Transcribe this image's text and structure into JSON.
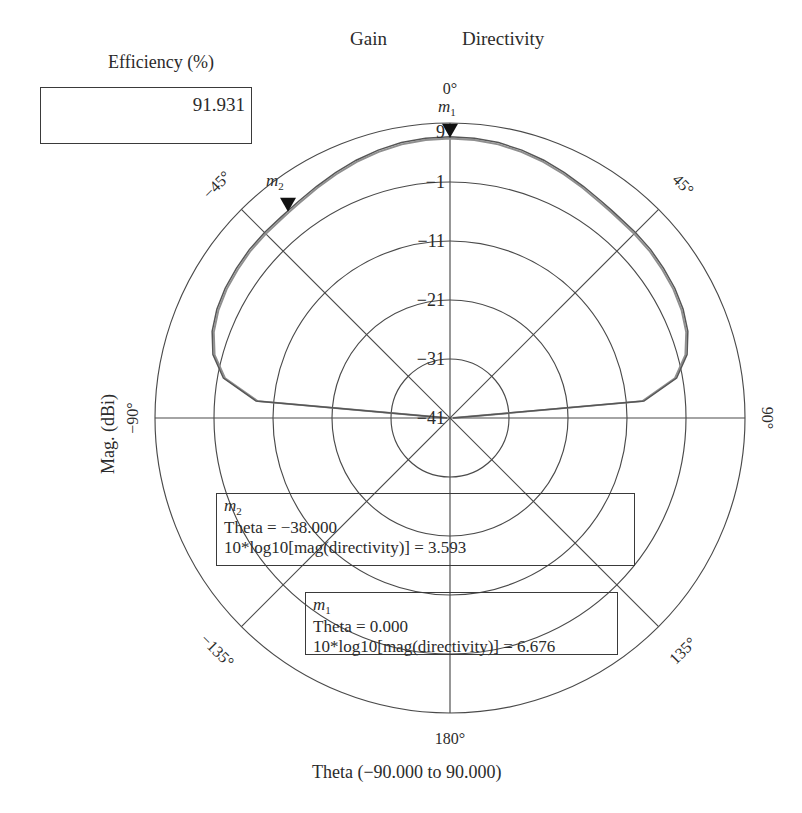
{
  "titles": {
    "gain": "Gain",
    "directivity": "Directivity"
  },
  "efficiency": {
    "caption": "Efficiency (%)",
    "value": "91.931"
  },
  "axes": {
    "y_caption": "Mag. (dBi)",
    "x_caption": "Theta (−90.000 to 90.000)"
  },
  "radial_ticks": [
    {
      "label": "9",
      "value": 9
    },
    {
      "label": "−1",
      "value": -1
    },
    {
      "label": "−11",
      "value": -11
    },
    {
      "label": "−21",
      "value": -21
    },
    {
      "label": "−31",
      "value": -31
    },
    {
      "label": "−41",
      "value": -41
    }
  ],
  "angular_ticks": [
    {
      "label": "0°",
      "angle": 0
    },
    {
      "label": "45°",
      "angle": 45
    },
    {
      "label": "90°",
      "angle": 90
    },
    {
      "label": "135°",
      "angle": 135
    },
    {
      "label": "180°",
      "angle": 180
    },
    {
      "label": "−135°",
      "angle": -135
    },
    {
      "label": "−90°",
      "angle": -90
    },
    {
      "label": "−45°",
      "angle": -45
    }
  ],
  "markers": [
    {
      "name": "m1",
      "tag": "m",
      "sub": "1",
      "theta_row": "Theta = 0.000",
      "value_row": "10*log10[mag(directivity)] = 6.676",
      "theta": 0.0,
      "value": 6.676
    },
    {
      "name": "m2",
      "tag": "m",
      "sub": "2",
      "theta_row": "Theta = −38.000",
      "value_row": "10*log10[mag(directivity)] = 3.593",
      "theta": -38.0,
      "value": 3.593
    }
  ],
  "colors": {
    "grid": "#4a4a4a",
    "trace_gain": "#8a8a8a",
    "trace_directivity": "#555555",
    "marker": "#111111",
    "text": "#2b2b2b"
  },
  "chart_data": {
    "type": "line",
    "plot_kind": "polar-radiation-pattern",
    "xlabel": "Theta (−90.000 to 90.000)",
    "ylabel": "Mag. (dBi)",
    "grid": true,
    "legend_position": "top",
    "rlim": [
      -41,
      9
    ],
    "r_tick_values": [
      9,
      -1,
      -11,
      -21,
      -31,
      -41
    ],
    "angle_range_deg": [
      -90,
      90
    ],
    "angular_tick_values": [
      0,
      45,
      90,
      135,
      180,
      -135,
      -90,
      -45
    ],
    "theta": [
      -90,
      -85,
      -80,
      -75,
      -70,
      -65,
      -60,
      -55,
      -50,
      -45,
      -40,
      -38,
      -35,
      -30,
      -25,
      -20,
      -15,
      -10,
      -5,
      0,
      5,
      10,
      15,
      20,
      25,
      30,
      35,
      38,
      40,
      45,
      50,
      55,
      60,
      65,
      70,
      75,
      80,
      85,
      90
    ],
    "series": [
      {
        "name": "Directivity",
        "values": [
          -40.5,
          -8.0,
          -2.0,
          0.6,
          1.9,
          2.6,
          3.0,
          3.2,
          3.4,
          3.45,
          3.5,
          3.593,
          3.8,
          4.3,
          4.9,
          5.5,
          6.0,
          6.4,
          6.6,
          6.676,
          6.6,
          6.4,
          6.0,
          5.5,
          4.9,
          4.3,
          3.8,
          3.593,
          3.5,
          3.45,
          3.4,
          3.2,
          3.0,
          2.6,
          1.9,
          0.6,
          -2.0,
          -8.0,
          -40.5
        ]
      },
      {
        "name": "Gain",
        "values": [
          -40.5,
          -8.3,
          -2.3,
          0.3,
          1.6,
          2.3,
          2.7,
          2.9,
          3.1,
          3.15,
          3.2,
          3.29,
          3.5,
          4.0,
          4.6,
          5.2,
          5.7,
          6.1,
          6.3,
          6.38,
          6.3,
          6.1,
          5.7,
          5.2,
          4.6,
          4.0,
          3.5,
          3.29,
          3.2,
          3.15,
          3.1,
          2.9,
          2.7,
          2.3,
          1.6,
          0.3,
          -2.3,
          -8.3,
          -40.5
        ]
      }
    ],
    "annotations": [
      {
        "marker": "m1",
        "theta": 0.0,
        "value": 6.676,
        "text": "Theta = 0.000 ; 10*log10[mag(directivity)] = 6.676"
      },
      {
        "marker": "m2",
        "theta": -38.0,
        "value": 3.593,
        "text": "Theta = −38.000 ; 10*log10[mag(directivity)] = 3.593"
      }
    ],
    "efficiency_percent": 91.931
  }
}
